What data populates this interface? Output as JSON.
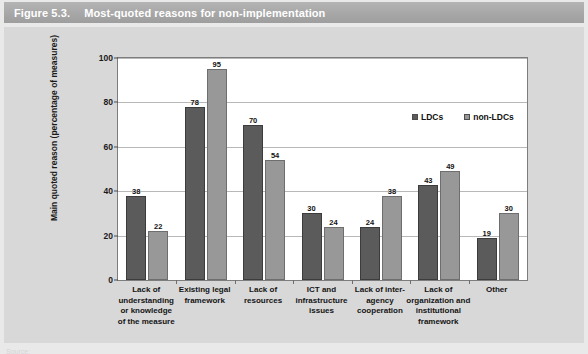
{
  "figure": {
    "number": "Figure 5.3.",
    "title": "Most-quoted reasons for non-implementation"
  },
  "source": {
    "text": "Source:"
  },
  "colors": {
    "banner": "#a6a6a6",
    "panel": "#d8d8d8",
    "plot_background": "#ffffff",
    "ldc_bar": "#5b5b5b",
    "non_ldc_bar": "#989898",
    "gridline": "#b8b8b8",
    "axis": "#7d7d7d"
  },
  "chart_data": {
    "type": "bar",
    "title": "Most-quoted reasons for non-implementation",
    "xlabel": "",
    "ylabel": "Main quoted reason (percentage of measures)",
    "ylim": [
      0,
      100
    ],
    "yticks": [
      0,
      20,
      40,
      60,
      80,
      100
    ],
    "ytick_labels": [
      "0",
      "20",
      "40",
      "60",
      "80",
      "100"
    ],
    "grid": true,
    "legend_position": "top-right inside plot",
    "categories": [
      "Lack of understanding or knowledge of the measure",
      "Existing legal framework",
      "Lack of resources",
      "ICT and infrastructure issues",
      "Lack of inter-agency cooperation",
      "Lack of organization and institutional framework",
      "Other"
    ],
    "category_lines": [
      [
        "Lack of",
        "understanding",
        "or knowledge",
        "of the measure"
      ],
      [
        "Existing legal",
        "framework"
      ],
      [
        "Lack of",
        "resources"
      ],
      [
        "ICT and",
        "infrastructure",
        "issues"
      ],
      [
        "Lack of inter-",
        "agency",
        "cooperation"
      ],
      [
        "Lack of",
        "organization and",
        "institutional",
        "framework"
      ],
      [
        "Other"
      ]
    ],
    "series": [
      {
        "name": "LDCs",
        "color": "#5b5b5b",
        "values": [
          38,
          78,
          70,
          30,
          24,
          43,
          19
        ]
      },
      {
        "name": "non-LDCs",
        "color": "#989898",
        "values": [
          22,
          95,
          54,
          24,
          38,
          49,
          30
        ]
      }
    ]
  }
}
